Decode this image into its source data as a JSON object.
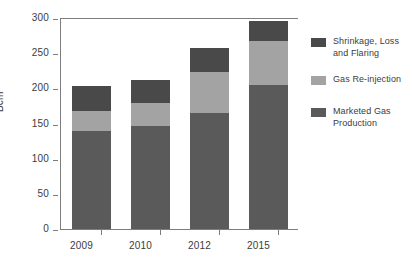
{
  "chart_data": {
    "type": "bar",
    "subtype": "stacked-vertical",
    "title": "",
    "xlabel": "",
    "ylabel": "Bcm",
    "ylim": [
      0,
      300
    ],
    "yticks": [
      0,
      50,
      100,
      150,
      200,
      250,
      300
    ],
    "ytick_labels": [
      "0",
      "50",
      "100",
      "150",
      "200",
      "250",
      "300"
    ],
    "grid": false,
    "legend_position": "right",
    "categories": [
      "2009",
      "2010",
      "2012",
      "2015"
    ],
    "series": [
      {
        "name": "Marketed Gas Production",
        "color": "#5a5a5a",
        "values": [
          140,
          147,
          165,
          205
        ]
      },
      {
        "name": "Gas Re-injection",
        "color": "#a3a3a3",
        "values": [
          28,
          32,
          58,
          63
        ]
      },
      {
        "name": "Shrinkage, Loss and Flaring",
        "color": "#494949",
        "values": [
          35,
          33,
          35,
          28
        ]
      }
    ],
    "stack_order_bottom_to_top": [
      "Marketed Gas Production",
      "Gas Re-injection",
      "Shrinkage, Loss and Flaring"
    ],
    "totals": [
      203,
      212,
      258,
      296
    ],
    "legend_entries": [
      {
        "label": "Shrinkage, Loss and Flaring",
        "color": "#494949"
      },
      {
        "label": "Gas Re-injection",
        "color": "#a3a3a3"
      },
      {
        "label": "Marketed Gas Production",
        "color": "#5a5a5a"
      }
    ]
  },
  "axis": {
    "y_title": "Bcm"
  },
  "colors": {
    "axis_line": "#7d7d7d",
    "text": "#3c3c3c",
    "background": "#ffffff"
  }
}
